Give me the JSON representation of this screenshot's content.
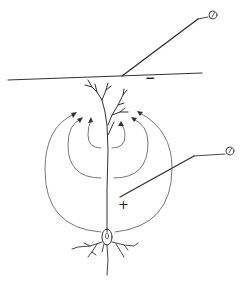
{
  "diagram": {
    "labels": {
      "surface_sign": "−",
      "depth_sign": "+"
    },
    "electrodes": [
      {
        "name": "surface-electrode",
        "symbol": "meter"
      },
      {
        "name": "depth-electrode",
        "symbol": "meter"
      }
    ],
    "colors": {
      "stroke": "#333333",
      "background": "#ffffff"
    }
  }
}
